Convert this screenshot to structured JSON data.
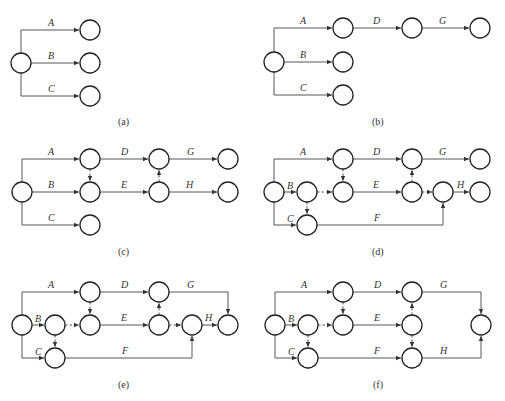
{
  "figure": {
    "panels": [
      {
        "id": "a",
        "caption": "(a)",
        "labels": {
          "A": "A",
          "B": "B",
          "C": "C"
        }
      },
      {
        "id": "b",
        "caption": "(b)",
        "labels": {
          "A": "A",
          "B": "B",
          "C": "C",
          "D": "D",
          "G": "G"
        }
      },
      {
        "id": "c",
        "caption": "(c)",
        "labels": {
          "A": "A",
          "B": "B",
          "C": "C",
          "D": "D",
          "E": "E",
          "G": "G",
          "H": "H"
        }
      },
      {
        "id": "d",
        "caption": "(d)",
        "labels": {
          "A": "A",
          "B": "B",
          "C": "C",
          "D": "D",
          "E": "E",
          "F": "F",
          "G": "G",
          "H": "H"
        }
      },
      {
        "id": "e",
        "caption": "(e)",
        "labels": {
          "A": "A",
          "B": "B",
          "C": "C",
          "D": "D",
          "E": "E",
          "F": "F",
          "G": "G",
          "H": "H"
        }
      },
      {
        "id": "f",
        "caption": "(f)",
        "labels": {
          "A": "A",
          "B": "B",
          "C": "C",
          "D": "D",
          "E": "E",
          "F": "F",
          "G": "G",
          "H": "H"
        }
      }
    ],
    "colors": {
      "node_stroke": "#222222",
      "edge": "#444444",
      "text": "#333333",
      "background": "#ffffff"
    }
  }
}
